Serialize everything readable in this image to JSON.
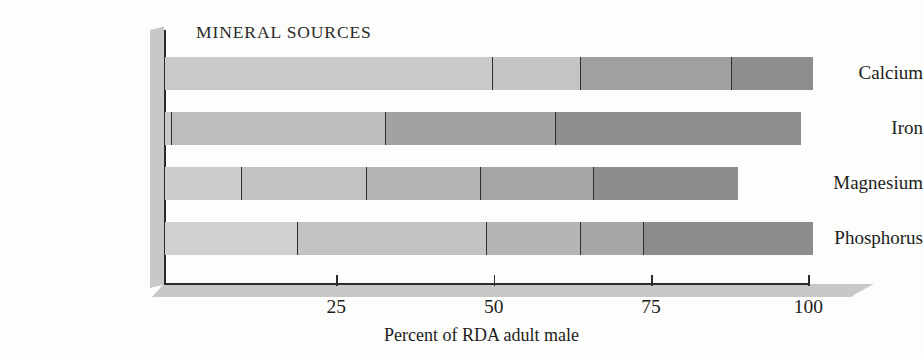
{
  "chart_data": {
    "type": "bar",
    "orientation": "horizontal",
    "stacked": true,
    "title": "MINERAL SOURCES",
    "xlabel": "Percent of RDA adult male",
    "ylabel": "",
    "xlim": [
      0,
      103
    ],
    "xticks": [
      25,
      50,
      75,
      100
    ],
    "xtick_labels": [
      "25",
      "50",
      "75",
      "100"
    ],
    "grid": false,
    "legend": "none",
    "categories": [
      "Calcium",
      "Iron",
      "Magnesium",
      "Phosphorus"
    ],
    "values": [
      103,
      101,
      91,
      103
    ],
    "series": [
      {
        "name": "Calcium",
        "cumulative_breaks": [
          52,
          66,
          90,
          103
        ],
        "segment_values": [
          52,
          14,
          24,
          13
        ]
      },
      {
        "name": "Iron",
        "cumulative_breaks": [
          1,
          35,
          62,
          101
        ],
        "segment_values": [
          1,
          34,
          27,
          39
        ]
      },
      {
        "name": "Magnesium",
        "cumulative_breaks": [
          12,
          32,
          50,
          68,
          91
        ],
        "segment_values": [
          12,
          20,
          18,
          18,
          23
        ]
      },
      {
        "name": "Phosphorus",
        "cumulative_breaks": [
          21,
          51,
          66,
          76,
          103
        ],
        "segment_values": [
          21,
          30,
          15,
          10,
          27
        ]
      }
    ]
  },
  "bars": [
    {
      "label": "Calcium",
      "segments": [
        {
          "value": 52,
          "color": "#c9c9c9"
        },
        {
          "value": 14,
          "color": "#c4c4c4"
        },
        {
          "value": 24,
          "color": "#a0a0a0"
        },
        {
          "value": 13,
          "color": "#8e8e8e"
        }
      ]
    },
    {
      "label": "Iron",
      "segments": [
        {
          "value": 1,
          "color": "#c9c9c9"
        },
        {
          "value": 34,
          "color": "#bdbdbd"
        },
        {
          "value": 27,
          "color": "#a2a2a2"
        },
        {
          "value": 39,
          "color": "#8f8f8f"
        }
      ]
    },
    {
      "label": "Magnesium",
      "segments": [
        {
          "value": 12,
          "color": "#cdcdcd"
        },
        {
          "value": 20,
          "color": "#c2c2c2"
        },
        {
          "value": 18,
          "color": "#b3b3b3"
        },
        {
          "value": 18,
          "color": "#a5a5a5"
        },
        {
          "value": 23,
          "color": "#8d8d8d"
        }
      ]
    },
    {
      "label": "Phosphorus",
      "segments": [
        {
          "value": 21,
          "color": "#d0d0d0"
        },
        {
          "value": 30,
          "color": "#c3c3c3"
        },
        {
          "value": 15,
          "color": "#b5b5b5"
        },
        {
          "value": 10,
          "color": "#a6a6a6"
        },
        {
          "value": 27,
          "color": "#8c8c8c"
        }
      ]
    }
  ],
  "axis": {
    "caption": "Percent of RDA adult male",
    "ticks": [
      {
        "value": 25,
        "label": "25"
      },
      {
        "value": 50,
        "label": "50"
      },
      {
        "value": 75,
        "label": "75"
      },
      {
        "value": 100,
        "label": "100"
      }
    ]
  },
  "geometry": {
    "origin_x": 179,
    "px_per_unit": 6.293,
    "bar_tops": [
      57,
      112,
      167,
      222
    ],
    "bar_height": 33
  }
}
